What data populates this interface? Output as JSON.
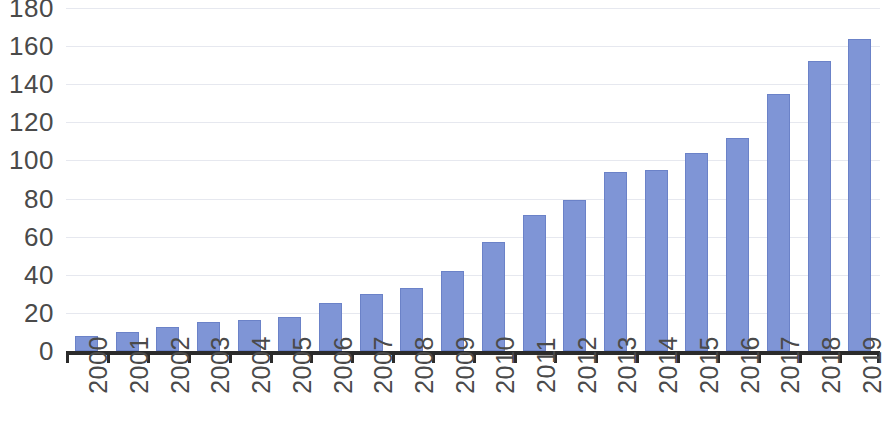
{
  "chart_data": {
    "type": "bar",
    "title": "",
    "subtitle": "",
    "xlabel": "",
    "ylabel": "",
    "categories": [
      "2000",
      "2001",
      "2002",
      "2003",
      "2004",
      "2005",
      "2006",
      "2007",
      "2008",
      "2009",
      "2010",
      "2011",
      "2012",
      "2013",
      "2014",
      "2015",
      "2016",
      "2017",
      "2018",
      "2019"
    ],
    "values": [
      8,
      10,
      12.5,
      15,
      16.5,
      18,
      25,
      30,
      33,
      42,
      57,
      71.5,
      79,
      94,
      95,
      104,
      112,
      135,
      152,
      164
    ],
    "series": [
      {
        "name": "",
        "values": [
          8,
          10,
          12.5,
          15,
          16.5,
          18,
          25,
          30,
          33,
          42,
          57,
          71.5,
          79,
          94,
          95,
          104,
          112,
          135,
          152,
          164
        ]
      }
    ],
    "ylim": [
      0,
      180
    ],
    "ytick_labels": [
      "180",
      "160",
      "140",
      "120",
      "100",
      "80",
      "60",
      "40",
      "20",
      "0"
    ],
    "ytick_values": [
      180,
      160,
      140,
      120,
      100,
      80,
      60,
      40,
      20,
      0
    ],
    "ytick_step": 20,
    "xtick_labels": [
      "2000",
      "2001",
      "2002",
      "2003",
      "2004",
      "2005",
      "2006",
      "2007",
      "2008",
      "2009",
      "2010",
      "2011",
      "2012",
      "2013",
      "2014",
      "2015",
      "2016",
      "2017",
      "2018",
      "2019"
    ],
    "xtick_rotation": -90,
    "grid": true,
    "grid_axis": "y",
    "legend": false,
    "legend_position": "none",
    "colors": {
      "bar_fill": "#7f95d6",
      "bar_stroke": "#6b82c8",
      "gridline": "#e6e8ef",
      "axis": "#2b2b2b",
      "tick_label": "#4a4a4a",
      "background": "#ffffff"
    }
  }
}
